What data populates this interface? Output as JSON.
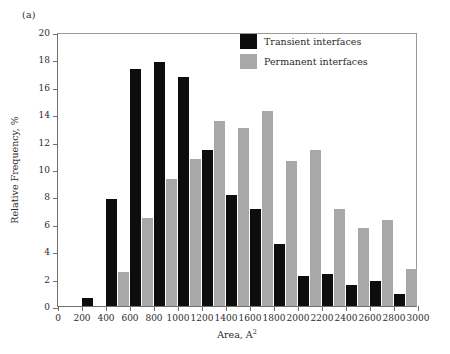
{
  "panel": {
    "label": "(a)"
  },
  "legend": {
    "position": "top-right-inside",
    "entries": [
      {
        "name": "Transient interfaces",
        "color": "#0d0d0d"
      },
      {
        "name": "Permanent interfaces",
        "color": "#a8a8a8"
      }
    ]
  },
  "chart_data": {
    "type": "bar",
    "title": "",
    "subtitle": "",
    "xlabel": "Area, A2",
    "xlabel_base": "Area, A",
    "xlabel_exponent": "2",
    "ylabel": "Relative Frequency, %",
    "xlim": [
      0,
      3000
    ],
    "ylim": [
      0,
      20
    ],
    "xticks": [
      0,
      200,
      400,
      600,
      800,
      1000,
      1200,
      1400,
      1600,
      1800,
      2000,
      2200,
      2400,
      2600,
      2800,
      3000
    ],
    "yticks": [
      0,
      2,
      4,
      6,
      8,
      10,
      12,
      14,
      16,
      18,
      20
    ],
    "grid": false,
    "bin_width": 200,
    "categories": [
      200,
      400,
      600,
      800,
      1000,
      1200,
      1400,
      1600,
      1800,
      2000,
      2200,
      2400,
      2600,
      2800
    ],
    "series": [
      {
        "name": "Transient interfaces",
        "color": "#0d0d0d",
        "values": [
          0.6,
          7.8,
          17.3,
          17.8,
          16.7,
          11.4,
          8.1,
          7.1,
          4.5,
          2.2,
          2.35,
          1.55,
          1.8,
          0.85
        ]
      },
      {
        "name": "Permanent interfaces",
        "color": "#a8a8a8",
        "values": [
          0.0,
          2.5,
          6.4,
          9.3,
          10.7,
          13.5,
          13.0,
          14.2,
          10.6,
          11.4,
          7.1,
          5.7,
          6.3,
          2.7
        ]
      }
    ]
  }
}
